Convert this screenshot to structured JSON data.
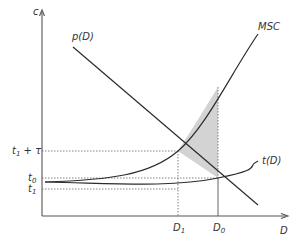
{
  "diagram": {
    "axes": {
      "y_label": "c",
      "x_label": "D"
    },
    "curves": [
      {
        "id": "pD",
        "label": "p(D)",
        "description": "downward-sloping demand curve"
      },
      {
        "id": "MSC",
        "label": "MSC",
        "description": "marginal social cost, convex increasing"
      },
      {
        "id": "tD",
        "label": "t(D)",
        "description": "private cost curve, mildly increasing"
      }
    ],
    "y_ticks": [
      {
        "label_main": "t",
        "label_sub": "1",
        "label_suffix": " + τ",
        "y": 151
      },
      {
        "label_main": "t",
        "label_sub": "0",
        "label_suffix": "",
        "y": 178
      },
      {
        "label_main": "t",
        "label_sub": "1",
        "label_suffix": "",
        "y": 189
      }
    ],
    "x_ticks": [
      {
        "label_main": "D",
        "label_sub": "1",
        "x": 178
      },
      {
        "label_main": "D",
        "label_sub": "0",
        "x": 218
      }
    ],
    "shaded_region": {
      "description": "deadweight loss triangle between MSC and p(D) from D1 to D0",
      "color": "#d3d3d3"
    },
    "colors": {
      "line": "#2b2b2b",
      "axis": "#555555",
      "dash": "#666666",
      "shade": "#d3d3d3"
    }
  }
}
